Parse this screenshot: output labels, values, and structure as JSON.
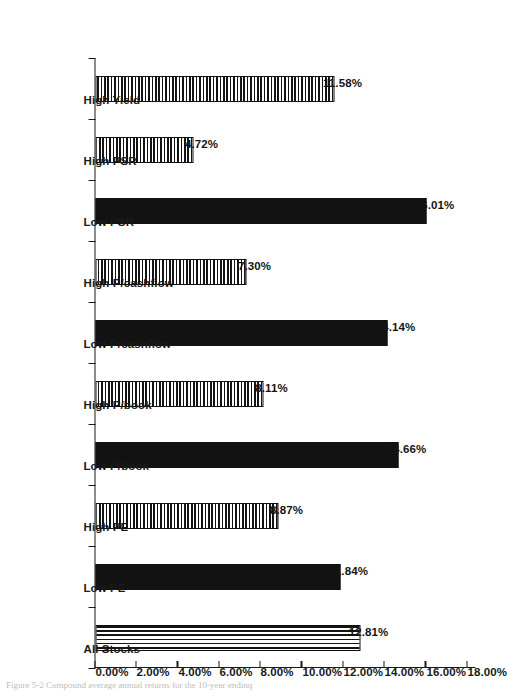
{
  "chart_data": {
    "type": "bar",
    "title": "",
    "subtitle": "",
    "xlabel": "",
    "ylabel": "",
    "orientation": "rotated-90",
    "grid": false,
    "legend": "none",
    "ylim": [
      0,
      18
    ],
    "ytick_step": 2,
    "categories": [
      "High Yield",
      "High PSR",
      "Low PSR",
      "High P/cashflow",
      "Low P/cashflow",
      "High P/book",
      "Low P/book",
      "High PE",
      "Low PE",
      "All Stocks"
    ],
    "values": [
      11.58,
      4.72,
      16.01,
      7.3,
      14.14,
      8.11,
      14.66,
      8.87,
      11.84,
      12.81
    ],
    "data_labels": [
      "11.58%",
      "4.72%",
      "16.01%",
      "7.30%",
      "14.14%",
      "8.11%",
      "14.66%",
      "8.87%",
      "11.84%",
      "12.81%"
    ],
    "bar_patterns": [
      "horizontal-lines",
      "horizontal-lines",
      "solid",
      "horizontal-lines",
      "solid",
      "horizontal-lines",
      "solid",
      "horizontal-lines",
      "solid",
      "vertical-lines"
    ],
    "ytick_labels": [
      "0.00%",
      "2.00%",
      "4.00%",
      "6.00%",
      "8.00%",
      "10.00%",
      "12.00%",
      "14.00%",
      "16.00%",
      "18.00%"
    ],
    "ytick_values": [
      0,
      2,
      4,
      6,
      8,
      10,
      12,
      14,
      16,
      18
    ],
    "colors": {
      "axis": "#1a1a1a",
      "bar_fill": "#121212",
      "bar_edge": "#101010",
      "background": "#ffffff",
      "label_text": "#141414"
    }
  },
  "caption": {
    "text": "Figure 5-2  Compound average annual returns for the 10-year endinq"
  }
}
